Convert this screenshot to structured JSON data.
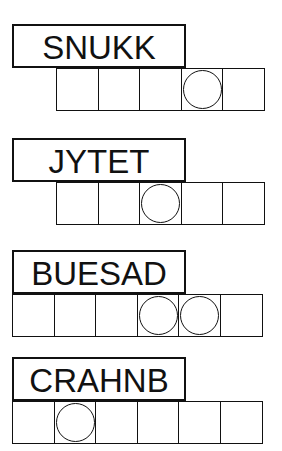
{
  "puzzles": [
    {
      "scrambled": "SNUKK",
      "cell_count": 5,
      "circled": [
        4
      ],
      "top": 24,
      "cells_left": 56
    },
    {
      "scrambled": "JYTET",
      "cell_count": 5,
      "circled": [
        3
      ],
      "top": 138,
      "cells_left": 56
    },
    {
      "scrambled": "BUESAD",
      "cell_count": 6,
      "circled": [
        4,
        5
      ],
      "top": 250,
      "cells_left": 12
    },
    {
      "scrambled": "CRAHNB",
      "cell_count": 6,
      "circled": [
        2
      ],
      "top": 357,
      "cells_left": 12
    }
  ],
  "colors": {
    "ink": "#111111",
    "background": "#ffffff"
  }
}
